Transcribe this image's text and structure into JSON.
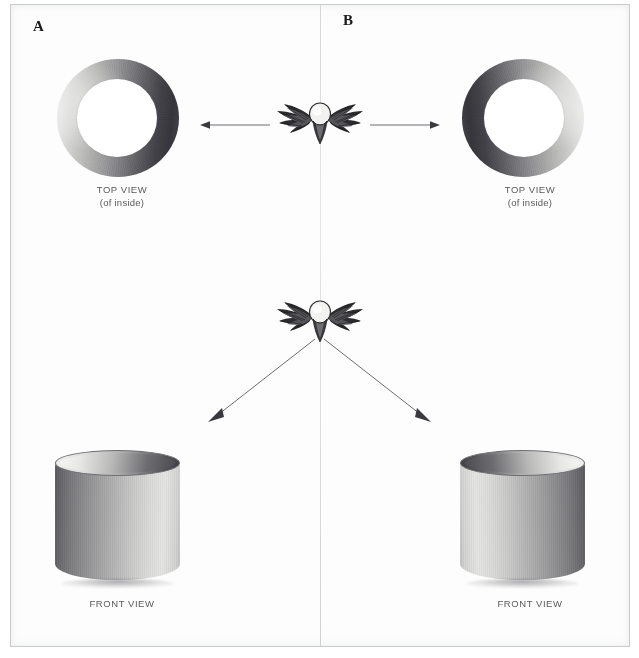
{
  "figure": {
    "background_color": "#ffffff",
    "frame_color": "#c9cbcd"
  },
  "panels": [
    {
      "id": "A",
      "letter": "A",
      "top_view": {
        "caption_line1": "TOP VIEW",
        "caption_line2": "(of inside)",
        "shading": "light-left-dark-right"
      },
      "front_view": {
        "caption": "FRONT VIEW",
        "shading": "dark-left-light-right"
      }
    },
    {
      "id": "B",
      "letter": "B",
      "top_view": {
        "caption_line1": "TOP VIEW",
        "caption_line2": "(of inside)",
        "shading": "dark-left-light-right"
      },
      "front_view": {
        "caption": "FRONT VIEW",
        "shading": "light-left-dark-right"
      }
    }
  ],
  "emblems": [
    {
      "name": "winged-eye-emblem-top",
      "description": "winged eye symbol, top row"
    },
    {
      "name": "winged-eye-emblem-bottom",
      "description": "winged eye symbol, bottom row"
    }
  ],
  "arrows": [
    {
      "name": "arrow-to-top-view-a",
      "direction": "left",
      "from": "emblem-top",
      "to": "ring-a"
    },
    {
      "name": "arrow-to-top-view-b",
      "direction": "right",
      "from": "emblem-top",
      "to": "ring-b"
    },
    {
      "name": "arrow-to-front-view-a",
      "direction": "down-left",
      "from": "emblem-bottom",
      "to": "cylinder-a"
    },
    {
      "name": "arrow-to-front-view-b",
      "direction": "down-right",
      "from": "emblem-bottom",
      "to": "cylinder-b"
    }
  ],
  "colors": {
    "text": "#59595b",
    "letter": "#1b1b1b",
    "arrow": "#5c5c60",
    "metal_light": "#efefef",
    "metal_dark": "#35353b"
  }
}
